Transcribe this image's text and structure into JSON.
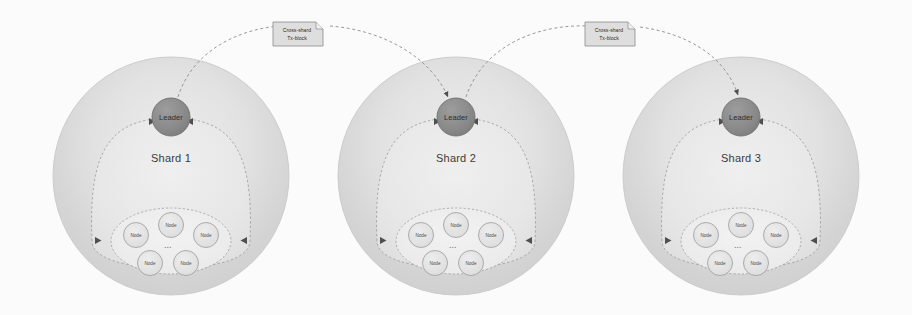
{
  "diagram": {
    "background_color": "#fbfbfb",
    "colors": {
      "shard_outer_fill": "#d9d9d9",
      "shard_outer_edge": "#d5d5d5",
      "shard_inner_fill": "#e6e6e6",
      "leader_fill": "#8a8a8a",
      "leader_stroke": "#6f6f6f",
      "node_fill": "#e2e2e2",
      "node_stroke": "#9a9a9a",
      "node_group_fill": "#efefef",
      "dash_stroke": "#8d8d8d",
      "note_fill": "#dedede",
      "note_stroke": "#8a8a8a",
      "text_color": "#3b3b3b"
    },
    "shards": [
      {
        "id": "shard-1",
        "label": "Shard 1",
        "leader_label": "Leader",
        "ellipsis": "...",
        "nodes": [
          {
            "label": "Node"
          },
          {
            "label": "Node"
          },
          {
            "label": "Node"
          },
          {
            "label": "Node"
          },
          {
            "label": "Node"
          }
        ]
      },
      {
        "id": "shard-2",
        "label": "Shard 2",
        "leader_label": "Leader",
        "ellipsis": "...",
        "nodes": [
          {
            "label": "Node"
          },
          {
            "label": "Node"
          },
          {
            "label": "Node"
          },
          {
            "label": "Node"
          },
          {
            "label": "Node"
          }
        ]
      },
      {
        "id": "shard-3",
        "label": "Shard 3",
        "leader_label": "Leader",
        "ellipsis": "...",
        "nodes": [
          {
            "label": "Node"
          },
          {
            "label": "Node"
          },
          {
            "label": "Node"
          },
          {
            "label": "Node"
          },
          {
            "label": "Node"
          }
        ]
      }
    ],
    "cross_shard_links": [
      {
        "id": "link-1-2",
        "from": "Shard 1",
        "to": "Shard 2",
        "note_line1": "Cross-shard",
        "note_line2": "Tx-block"
      },
      {
        "id": "link-2-3",
        "from": "Shard 2",
        "to": "Shard 3",
        "note_line1": "Cross-shard",
        "note_line2": "Tx-block"
      }
    ]
  }
}
